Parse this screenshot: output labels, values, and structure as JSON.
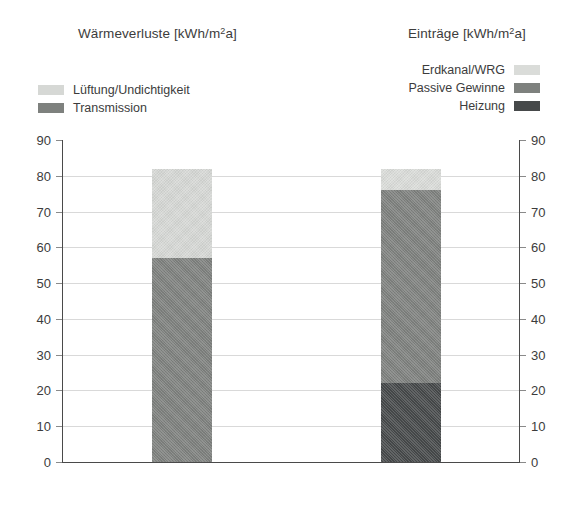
{
  "chart_data": {
    "type": "bar",
    "subtype": "stacked",
    "title": "",
    "panels": [
      {
        "id": "losses",
        "title": "Wärmeverluste [kWh/m²a]",
        "title_base": "Wärmeverluste [kWh/m",
        "title_sup": "2",
        "title_tail": "a]",
        "category": "Wärmeverluste",
        "total": 82,
        "legend_position": "top-left",
        "series": [
          {
            "name": "Lüftung/Undichtigkeit",
            "value": 25,
            "from": 57,
            "to": 82,
            "color": "#d6d8d5"
          },
          {
            "name": "Transmission",
            "value": 57,
            "from": 0,
            "to": 57,
            "color": "#7e817e"
          }
        ]
      },
      {
        "id": "gains",
        "title": "Einträge [kWh/m²a]",
        "title_base": "Einträge [kWh/m",
        "title_sup": "2",
        "title_tail": "a]",
        "category": "Einträge",
        "total": 82,
        "legend_position": "top-right",
        "series": [
          {
            "name": "Erdkanal/WRG",
            "value": 6,
            "from": 76,
            "to": 82,
            "color": "#dadcd9"
          },
          {
            "name": "Passive Gewinne",
            "value": 54,
            "from": 22,
            "to": 76,
            "color": "#7e817e"
          },
          {
            "name": "Heizung",
            "value": 22,
            "from": 0,
            "to": 22,
            "color": "#46494a"
          }
        ]
      }
    ],
    "xlabel": "",
    "ylabel": "",
    "ylim": [
      0,
      90
    ],
    "ytick_step": 10,
    "yticks": [
      90,
      80,
      70,
      60,
      50,
      40,
      30,
      20,
      10,
      0
    ],
    "ytick_labels_left": [
      "90",
      "80",
      "70",
      "60",
      "50",
      "40",
      "30",
      "20",
      "10",
      "0"
    ],
    "ytick_labels_right": [
      "90",
      "80",
      "70",
      "60",
      "50",
      "40",
      "30",
      "20",
      "10",
      "0"
    ],
    "grid": true,
    "grid_axis": "y",
    "grid_color": "#d9d9d9",
    "axis_color": "#4a4a4a",
    "background": "#ffffff",
    "dual_axis": true,
    "legend": {
      "left": [
        {
          "label": "Lüftung/Undichtigkeit",
          "color": "#d6d8d5"
        },
        {
          "label": "Transmission",
          "color": "#7e817e"
        }
      ],
      "right": [
        {
          "label": "Erdkanal/WRG",
          "color": "#dadcd9"
        },
        {
          "label": "Passive Gewinne",
          "color": "#7e817e"
        },
        {
          "label": "Heizung",
          "color": "#46494a"
        }
      ]
    }
  }
}
